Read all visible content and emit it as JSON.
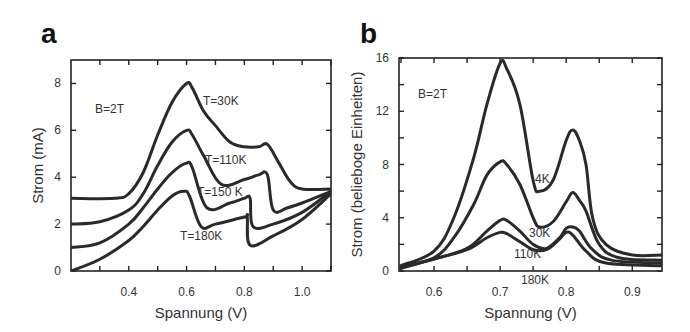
{
  "panels": {
    "a": {
      "letter": "a"
    },
    "b": {
      "letter": "b"
    }
  },
  "chart_data": [
    {
      "panel": "a",
      "type": "line",
      "title": "",
      "xlabel": "Spannung (V)",
      "ylabel": "Strom (mA)",
      "xlim": [
        0.2,
        1.1
      ],
      "ylim": [
        0,
        9
      ],
      "xticks": [
        0.4,
        0.6,
        0.8,
        1.0
      ],
      "xtick_labels": [
        "0.4",
        "0.6",
        "0.8",
        "1.0"
      ],
      "yticks": [
        0,
        2,
        4,
        6,
        8
      ],
      "ytick_labels": [
        "0",
        "2",
        "4",
        "6",
        "8"
      ],
      "grid": false,
      "annotations": [
        "B=2T",
        "T=30K",
        "T=110K",
        "T=150 K",
        "T=180K"
      ],
      "series": [
        {
          "name": "T=30K",
          "x": [
            0.2,
            0.35,
            0.4,
            0.45,
            0.5,
            0.55,
            0.6,
            0.62,
            0.66,
            0.7,
            0.75,
            0.8,
            0.85,
            0.88,
            0.92,
            0.96,
            1.0,
            1.1
          ],
          "y": [
            3.1,
            3.1,
            3.3,
            4.2,
            5.8,
            7.2,
            8.0,
            7.8,
            6.8,
            6.2,
            5.5,
            5.3,
            5.3,
            5.4,
            4.6,
            3.8,
            3.5,
            3.5
          ]
        },
        {
          "name": "T=110K",
          "x": [
            0.2,
            0.3,
            0.4,
            0.45,
            0.5,
            0.55,
            0.6,
            0.62,
            0.66,
            0.72,
            0.8,
            0.85,
            0.88,
            0.9,
            0.95,
            1.0,
            1.1
          ],
          "y": [
            2.0,
            2.1,
            2.6,
            3.3,
            4.5,
            5.5,
            6.0,
            5.8,
            4.9,
            3.7,
            3.9,
            4.1,
            4.1,
            2.6,
            2.7,
            2.9,
            3.4
          ]
        },
        {
          "name": "T=150 K",
          "x": [
            0.2,
            0.3,
            0.4,
            0.45,
            0.5,
            0.55,
            0.6,
            0.62,
            0.67,
            0.75,
            0.8,
            0.82,
            0.83,
            0.9,
            1.0,
            1.1
          ],
          "y": [
            1.0,
            1.2,
            2.0,
            2.7,
            3.5,
            4.2,
            4.6,
            4.4,
            2.7,
            2.9,
            3.1,
            3.1,
            1.9,
            2.0,
            2.5,
            3.4
          ]
        },
        {
          "name": "T=180K",
          "x": [
            0.2,
            0.3,
            0.4,
            0.45,
            0.5,
            0.55,
            0.59,
            0.61,
            0.65,
            0.7,
            0.8,
            0.81,
            0.82,
            0.9,
            1.0,
            1.1
          ],
          "y": [
            0.0,
            0.5,
            1.3,
            1.9,
            2.6,
            3.2,
            3.4,
            3.2,
            1.9,
            2.0,
            2.3,
            2.3,
            1.1,
            1.5,
            2.2,
            3.3
          ]
        }
      ]
    },
    {
      "panel": "b",
      "type": "line",
      "title": "",
      "xlabel": "Spannung (V)",
      "ylabel": "Strom (beliebоge Einheiten)",
      "xlim": [
        0.547,
        0.945
      ],
      "ylim": [
        0,
        16
      ],
      "xticks": [
        0.6,
        0.7,
        0.8,
        0.9
      ],
      "xtick_labels": [
        "0.6",
        "0.7",
        "0.8",
        "0.9"
      ],
      "yticks": [
        0,
        4,
        8,
        12,
        16
      ],
      "ytick_labels": [
        "0",
        "4",
        "8",
        "12",
        "16"
      ],
      "grid": false,
      "annotations": [
        "B=2T",
        "4K",
        "30K",
        "110K",
        "180K"
      ],
      "series": [
        {
          "name": "4K",
          "x": [
            0.55,
            0.6,
            0.63,
            0.66,
            0.68,
            0.7,
            0.71,
            0.73,
            0.75,
            0.76,
            0.78,
            0.8,
            0.81,
            0.82,
            0.83,
            0.84,
            0.86,
            0.9,
            0.945
          ],
          "y": [
            0.4,
            1.5,
            4.0,
            8.5,
            12.5,
            15.6,
            15.2,
            12.5,
            6.8,
            6.0,
            6.8,
            9.8,
            10.6,
            9.8,
            8.0,
            4.0,
            2.0,
            1.2,
            1.2
          ]
        },
        {
          "name": "30K",
          "x": [
            0.55,
            0.6,
            0.63,
            0.66,
            0.68,
            0.7,
            0.71,
            0.73,
            0.75,
            0.76,
            0.78,
            0.8,
            0.81,
            0.82,
            0.83,
            0.85,
            0.88,
            0.945
          ],
          "y": [
            0.3,
            1.0,
            2.5,
            5.0,
            7.2,
            8.2,
            8.0,
            6.5,
            4.0,
            3.3,
            3.7,
            5.2,
            5.9,
            5.3,
            4.5,
            2.0,
            1.0,
            0.8
          ]
        },
        {
          "name": "110K",
          "x": [
            0.55,
            0.6,
            0.65,
            0.68,
            0.7,
            0.71,
            0.73,
            0.75,
            0.77,
            0.79,
            0.8,
            0.81,
            0.82,
            0.84,
            0.87,
            0.945
          ],
          "y": [
            0.3,
            0.9,
            1.7,
            3.0,
            3.8,
            3.8,
            3.0,
            2.0,
            1.7,
            2.5,
            3.2,
            3.3,
            3.0,
            1.6,
            0.8,
            0.6
          ]
        },
        {
          "name": "180K",
          "x": [
            0.55,
            0.6,
            0.65,
            0.68,
            0.7,
            0.71,
            0.73,
            0.75,
            0.77,
            0.79,
            0.8,
            0.81,
            0.83,
            0.86,
            0.945
          ],
          "y": [
            0.2,
            0.9,
            1.6,
            2.5,
            2.9,
            2.8,
            2.2,
            1.6,
            1.6,
            2.4,
            2.9,
            2.7,
            1.5,
            0.6,
            0.4
          ]
        }
      ]
    }
  ]
}
